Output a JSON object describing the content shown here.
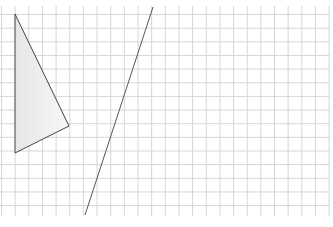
{
  "grid": {
    "x0": 1.5,
    "y0": 14.5,
    "spacing": 13.65,
    "cols": 25,
    "rows": 15,
    "x_end": 330,
    "y_top": 6,
    "y_bottom": 216,
    "color": "#d6d6d6"
  },
  "triangle": {
    "points": [
      [
        15,
        14
      ],
      [
        69,
        126
      ],
      [
        15,
        153
      ]
    ],
    "stroke": "#444444",
    "fill_from": "#e6e6e6",
    "fill_to": "#f7f7f7"
  },
  "line": {
    "from": [
      153,
      7
    ],
    "to": [
      85,
      215
    ],
    "stroke": "#555555"
  }
}
